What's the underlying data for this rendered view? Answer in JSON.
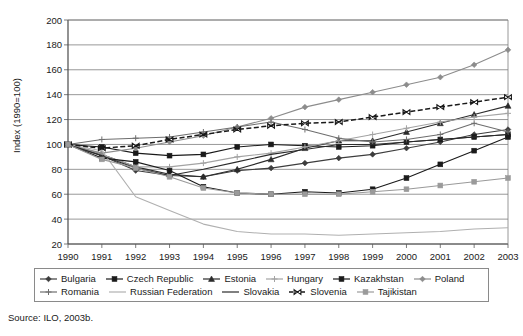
{
  "figure": {
    "source_note": "Source: ILO, 2003b.",
    "ylabel": "Index (1990=100)"
  },
  "chart_data": {
    "type": "line",
    "title": "",
    "xlabel": "",
    "ylabel": "Index (1990=100)",
    "grid": true,
    "legend_position": "bottom",
    "xlim": [
      1990,
      2003
    ],
    "ylim": [
      20,
      200
    ],
    "ytick_step": 20,
    "yticks": [
      20,
      40,
      60,
      80,
      100,
      120,
      140,
      160,
      180,
      200
    ],
    "categories": [
      "1990",
      "1991",
      "1992",
      "1993",
      "1994",
      "1995",
      "1996",
      "1997",
      "1998",
      "1999",
      "2000",
      "2001",
      "2002",
      "2003"
    ],
    "x": [
      1990,
      1991,
      1992,
      1993,
      1994,
      1995,
      1996,
      1997,
      1998,
      1999,
      2000,
      2001,
      2002,
      2003
    ],
    "series": [
      {
        "name": "Bulgaria",
        "color": "#3d3d3d",
        "marker": "diamond",
        "dash": "solid",
        "values": [
          100,
          91,
          79,
          75,
          74,
          79,
          81,
          85,
          89,
          92,
          97,
          102,
          108,
          112
        ]
      },
      {
        "name": "Czech Republic",
        "color": "#1a1a1a",
        "marker": "square",
        "dash": "solid",
        "values": [
          100,
          98,
          93,
          91,
          92,
          98,
          100,
          99,
          98,
          99,
          102,
          104,
          106,
          108
        ]
      },
      {
        "name": "Estonia",
        "color": "#2b2b2b",
        "marker": "triangle",
        "dash": "solid",
        "values": [
          100,
          92,
          82,
          76,
          74,
          80,
          88,
          97,
          103,
          103,
          110,
          117,
          124,
          131
        ]
      },
      {
        "name": "Hungary",
        "color": "#a3a3a3",
        "marker": "plus",
        "dash": "solid",
        "values": [
          100,
          92,
          82,
          82,
          85,
          90,
          93,
          98,
          103,
          108,
          113,
          118,
          122,
          125
        ]
      },
      {
        "name": "Kazakhstan",
        "color": "#1a1a1a",
        "marker": "square",
        "dash": "solid",
        "values": [
          100,
          89,
          86,
          79,
          66,
          61,
          60,
          62,
          61,
          64,
          73,
          84,
          95,
          106
        ]
      },
      {
        "name": "Poland",
        "color": "#8c8c8c",
        "marker": "diamond",
        "dash": "solid",
        "values": [
          100,
          93,
          97,
          102,
          107,
          114,
          121,
          130,
          136,
          142,
          148,
          154,
          164,
          176
        ]
      },
      {
        "name": "Romania",
        "color": "#6e6e6e",
        "marker": "plus",
        "dash": "solid",
        "values": [
          100,
          104,
          105,
          106,
          110,
          114,
          118,
          112,
          105,
          102,
          104,
          108,
          117,
          110
        ]
      },
      {
        "name": "Russian Federation",
        "color": "#b0b0b0",
        "marker": "none",
        "dash": "solid",
        "values": [
          100,
          95,
          58,
          47,
          36,
          30,
          28,
          28,
          27,
          28,
          29,
          30,
          32,
          33
        ]
      },
      {
        "name": "Slovakia",
        "color": "#2b2b2b",
        "marker": "none",
        "dash": "solid",
        "values": [
          100,
          91,
          81,
          75,
          80,
          86,
          92,
          96,
          100,
          100,
          102,
          104,
          106,
          108
        ]
      },
      {
        "name": "Slovenia",
        "color": "#1a1a1a",
        "marker": "bowtie",
        "dash": "dashed",
        "values": [
          100,
          97,
          99,
          104,
          108,
          112,
          115,
          117,
          118,
          122,
          126,
          130,
          134,
          138
        ]
      },
      {
        "name": "Tajikistan",
        "color": "#9a9a9a",
        "marker": "square",
        "dash": "solid",
        "values": [
          100,
          88,
          81,
          74,
          65,
          61,
          60,
          60,
          60,
          62,
          64,
          67,
          70,
          73
        ]
      }
    ]
  }
}
